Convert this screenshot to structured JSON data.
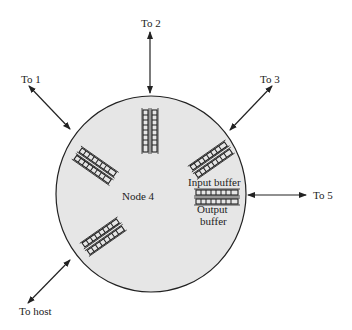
{
  "diagram": {
    "node_label": "Node 4",
    "input_buffer_label": "Input buffer",
    "output_buffer_label_1": "Output",
    "output_buffer_label_2": "buffer",
    "links": {
      "to1": "To 1",
      "to2": "To 2",
      "to3": "To 3",
      "to5": "To 5",
      "host": "To host"
    },
    "colors": {
      "node_fill": "#e6e6e6",
      "stroke": "#222222"
    }
  }
}
